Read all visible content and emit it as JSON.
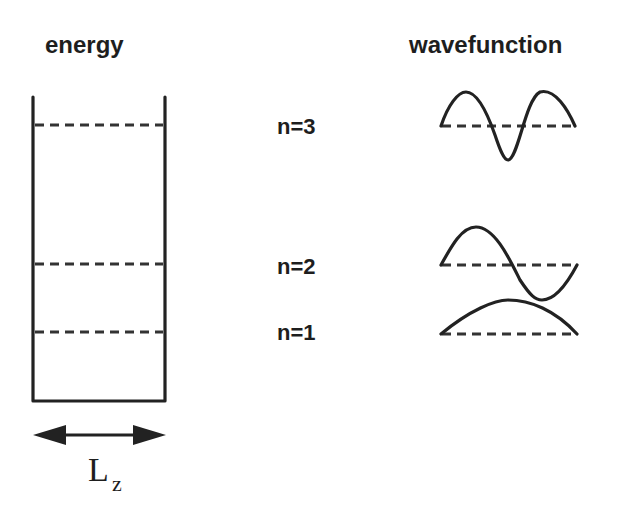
{
  "headings": {
    "energy": "energy",
    "wavefunction": "wavefunction"
  },
  "levels": [
    {
      "label": "n=3",
      "n": 3
    },
    {
      "label": "n=2",
      "n": 2
    },
    {
      "label": "n=1",
      "n": 1
    }
  ],
  "width_label": {
    "main": "L",
    "subscript": "z"
  },
  "colors": {
    "ink": "#222222",
    "background": "#ffffff"
  }
}
